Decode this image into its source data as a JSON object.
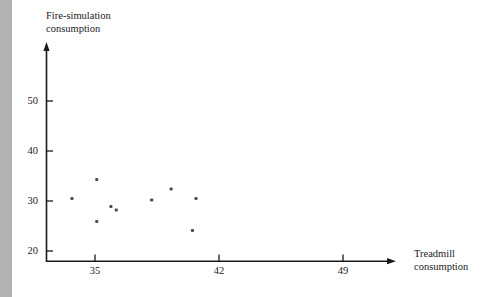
{
  "chart_data": {
    "type": "scatter",
    "title": "",
    "xlabel": "Treadmill consumption",
    "ylabel": "Fire-simulation consumption",
    "xticks": [
      35,
      42,
      49
    ],
    "yticks": [
      20,
      30,
      40,
      50
    ],
    "xlim": [
      32,
      51
    ],
    "ylim": [
      18,
      56
    ],
    "grid": false,
    "legend": null,
    "marker_color": "#4d4d4d",
    "axis_color": "#1a1a1a",
    "points": [
      {
        "x": 33.7,
        "y": 30.5
      },
      {
        "x": 35.1,
        "y": 34.3
      },
      {
        "x": 35.1,
        "y": 25.9
      },
      {
        "x": 35.9,
        "y": 28.9
      },
      {
        "x": 36.2,
        "y": 28.2
      },
      {
        "x": 38.2,
        "y": 30.2
      },
      {
        "x": 39.3,
        "y": 32.4
      },
      {
        "x": 40.7,
        "y": 30.5
      },
      {
        "x": 40.5,
        "y": 24.1
      }
    ]
  },
  "labels": {
    "y_axis_title": "Fire-simulation\nconsumption",
    "x_axis_title": "Treadmill\nconsumption",
    "ytick_20": "20",
    "ytick_30": "30",
    "ytick_40": "40",
    "ytick_50": "50",
    "xtick_35": "35",
    "xtick_42": "42",
    "xtick_49": "49"
  }
}
